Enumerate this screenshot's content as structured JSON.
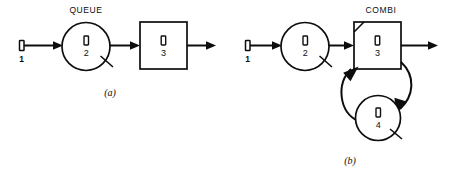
{
  "figure": {
    "background_color": "#ffffff",
    "line_color": "#0d0d0d",
    "width": 455,
    "height": 174
  },
  "subfigures": [
    {
      "id": "a",
      "label": "(a)",
      "header_label": "QUEUE",
      "nodes": [
        {
          "kind": "source",
          "number": "1",
          "glyph": "activity-box-glyph"
        },
        {
          "kind": "circle",
          "number": "2",
          "glyph": "activity-box-glyph",
          "has_slash": true
        },
        {
          "kind": "square",
          "number": "3",
          "glyph": "activity-box-glyph",
          "has_slash": false
        }
      ]
    },
    {
      "id": "b",
      "label": "(b)",
      "header_label": "COMBI",
      "nodes": [
        {
          "kind": "source",
          "number": "1",
          "glyph": "activity-box-glyph"
        },
        {
          "kind": "circle",
          "number": "2",
          "glyph": "activity-box-glyph",
          "has_slash": true
        },
        {
          "kind": "square",
          "number": "3",
          "glyph": "activity-box-glyph",
          "has_slash": false,
          "corner_mark": true
        },
        {
          "kind": "circle",
          "number": "4",
          "glyph": "activity-box-glyph",
          "has_slash": true
        }
      ]
    }
  ],
  "labels": {
    "queue": "QUEUE",
    "combi": "COMBI",
    "subfig_a": "(a)",
    "subfig_b": "(b)",
    "n1a": "1",
    "n2a": "2",
    "n3a": "3",
    "n1b": "1",
    "n2b": "2",
    "n3b": "3",
    "n4b": "4"
  }
}
